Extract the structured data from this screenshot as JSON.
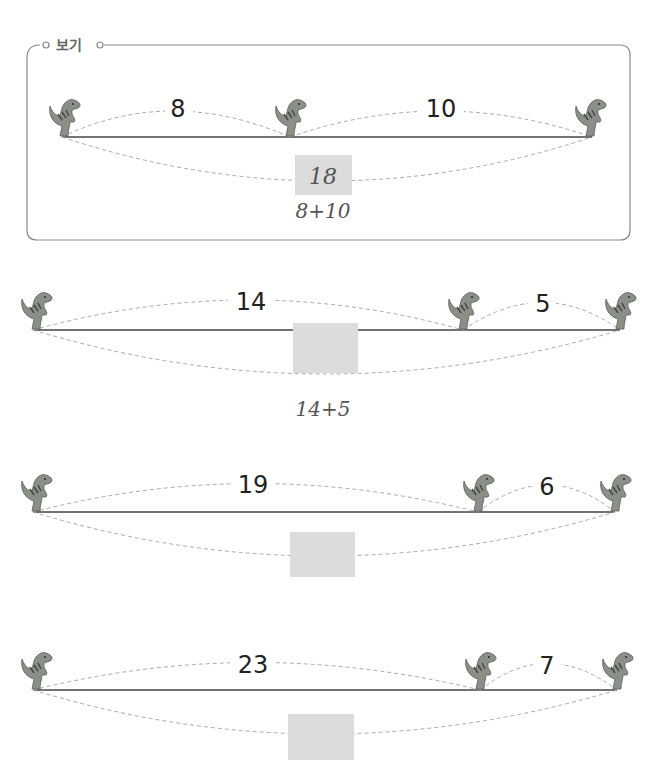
{
  "example": {
    "title": "보기",
    "segments": [
      "8",
      "10"
    ],
    "answer": "18",
    "expression": "8+10"
  },
  "problems": [
    {
      "segments": [
        "14",
        "5"
      ],
      "answer": "",
      "expression": "14+5"
    },
    {
      "segments": [
        "19",
        "6"
      ],
      "answer": "",
      "expression": ""
    },
    {
      "segments": [
        "23",
        "7"
      ],
      "answer": "",
      "expression": ""
    }
  ],
  "colors": {
    "frame": "#888888",
    "answer_box": "#dcdcdc",
    "dashed_arc": "#aaaaaa",
    "dino": "#8a8f88"
  }
}
